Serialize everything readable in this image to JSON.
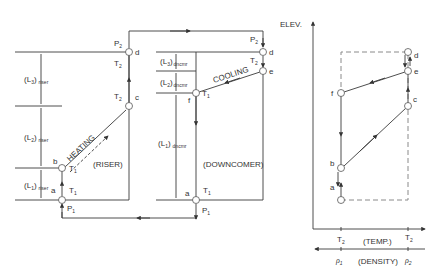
{
  "diagram": {
    "riser": {
      "label": "(RISER)",
      "process_label": "HEATING",
      "segments": [
        {
          "name": "L",
          "sub": "1",
          "suffix": "riser"
        },
        {
          "name": "L",
          "sub": "2",
          "suffix": "riser"
        },
        {
          "name": "L",
          "sub": "3",
          "suffix": "riser"
        }
      ],
      "points": {
        "a": {
          "id": "a",
          "temp": "T",
          "temp_sub": "1",
          "press": "P",
          "press_sub": "1"
        },
        "b": {
          "id": "b",
          "temp": "T",
          "temp_sub": "1"
        },
        "c": {
          "id": "c",
          "temp": "T",
          "temp_sub": "2"
        },
        "d": {
          "id": "d",
          "temp": "T",
          "temp_sub": "2",
          "press": "P",
          "press_sub": "2"
        }
      }
    },
    "downcomer": {
      "label": "(DOWNCOMER)",
      "process_label": "COOLING",
      "segments": [
        {
          "name": "L",
          "sub": "1",
          "suffix": "dncmr"
        },
        {
          "name": "L",
          "sub": "2",
          "suffix": "dncmr"
        },
        {
          "name": "L",
          "sub": "3",
          "suffix": "dncmr"
        }
      ],
      "points": {
        "a": {
          "id": "a",
          "temp": "T",
          "temp_sub": "1",
          "press": "P",
          "press_sub": "1"
        },
        "d": {
          "id": "d",
          "press": "P",
          "press_sub": "2"
        },
        "e": {
          "id": "e",
          "temp": "T",
          "temp_sub": "2"
        },
        "f": {
          "id": "f",
          "temp": "T",
          "temp_sub": "1"
        }
      }
    },
    "plot": {
      "y_axis_label": "ELEV.",
      "x_axis_label": "(TEMP.)",
      "x_ticks": [
        {
          "t": "T",
          "sub": "2"
        },
        {
          "t": "T",
          "sub": "2"
        }
      ],
      "density_label": "(DENSITY)",
      "density_ticks": [
        {
          "t": "ρ",
          "sub": "1"
        },
        {
          "t": "ρ",
          "sub": "2"
        }
      ],
      "point_labels": [
        "a",
        "b",
        "c",
        "d",
        "e",
        "f"
      ]
    }
  }
}
